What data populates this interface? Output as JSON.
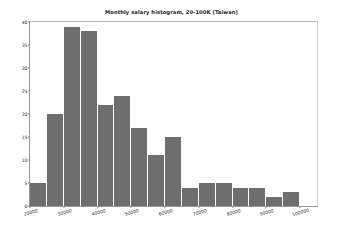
{
  "chart_data": {
    "type": "bar",
    "title": "Monthly salary histogram, 20-100K (Taiwan)",
    "xlabel": "",
    "ylabel": "",
    "grid": false,
    "legend": null,
    "xlim": [
      20000,
      105000
    ],
    "ylim": [
      0,
      40
    ],
    "ytick_labels": [
      "0",
      "5",
      "10",
      "15",
      "20",
      "25",
      "30",
      "35",
      "40"
    ],
    "ytick_values": [
      0,
      5,
      10,
      15,
      20,
      25,
      30,
      35,
      40
    ],
    "xtick_labels": [
      "20000",
      "30000",
      "40000",
      "50000",
      "60000",
      "70000",
      "80000",
      "90000",
      "100000"
    ],
    "xtick_values": [
      20000,
      30000,
      40000,
      50000,
      60000,
      70000,
      80000,
      90000,
      100000
    ],
    "bin_edges": [
      20000,
      25000,
      30000,
      35000,
      40000,
      45000,
      50000,
      55000,
      60000,
      65000,
      70000,
      75000,
      80000,
      85000,
      90000,
      95000,
      100000
    ],
    "categories": [
      "20000-25000",
      "25000-30000",
      "30000-35000",
      "35000-40000",
      "40000-45000",
      "45000-50000",
      "50000-55000",
      "55000-60000",
      "60000-65000",
      "65000-70000",
      "70000-75000",
      "75000-80000",
      "80000-85000",
      "85000-90000",
      "90000-95000",
      "95000-100000"
    ],
    "values": [
      5,
      20,
      39,
      38,
      22,
      24,
      17,
      11,
      15,
      4,
      5,
      5,
      4,
      4,
      2,
      3
    ],
    "bar_color": "#6e6e6e",
    "bar_edge_color": "#ffffff",
    "background_color": "#ffffff",
    "axes_color": "#9a9a9a"
  }
}
